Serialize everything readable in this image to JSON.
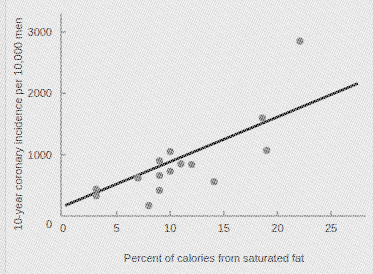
{
  "chart_data": {
    "type": "scatter",
    "title": "",
    "xlabel": "Percent of calories from saturated fat",
    "ylabel": "10-year coronary incidence per 10,000 men",
    "xlim": [
      0,
      27.5
    ],
    "ylim": [
      0,
      3300
    ],
    "xticks": [
      0,
      5,
      10,
      15,
      20,
      25
    ],
    "xtick_labels": [
      "0",
      "5",
      "10",
      "15",
      "20",
      "25"
    ],
    "yticks": [
      1000,
      2000,
      3000
    ],
    "ytick_labels": [
      "1000",
      "2000",
      "3000"
    ],
    "y_origin_label": "0",
    "grid": false,
    "legend": false,
    "point_color": "#6e6e6e",
    "line_color": "#000000",
    "axis_color": "#8a8a8a",
    "background_color": "#e8e8e8",
    "points": [
      {
        "x": 3.1,
        "y": 440
      },
      {
        "x": 3.1,
        "y": 330
      },
      {
        "x": 7.0,
        "y": 620
      },
      {
        "x": 8.0,
        "y": 170
      },
      {
        "x": 9.0,
        "y": 900
      },
      {
        "x": 9.0,
        "y": 660
      },
      {
        "x": 9.0,
        "y": 420
      },
      {
        "x": 10.0,
        "y": 1050
      },
      {
        "x": 10.0,
        "y": 730
      },
      {
        "x": 11.0,
        "y": 850
      },
      {
        "x": 12.0,
        "y": 840
      },
      {
        "x": 14.1,
        "y": 560
      },
      {
        "x": 18.6,
        "y": 1600
      },
      {
        "x": 19.0,
        "y": 1070
      },
      {
        "x": 22.1,
        "y": 2850
      }
    ],
    "trend_line": {
      "type": "linear-fit",
      "x_start": 0.2,
      "y_start": 170,
      "x_end": 27.5,
      "y_end": 2160
    }
  }
}
